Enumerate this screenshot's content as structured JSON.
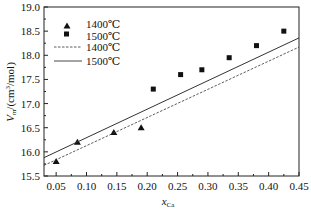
{
  "chart_data": {
    "type": "scatter",
    "title": "",
    "xlabel": "x_Ca",
    "xlabel_main": "x",
    "xlabel_sub": "Ca",
    "ylabel": "V_m/(cm³/mol)",
    "ylabel_main": "V",
    "ylabel_sub": "m",
    "ylabel_rest": "/(cm",
    "ylabel_sup": "3",
    "ylabel_end": "/mol)",
    "xlim": [
      0.03,
      0.45
    ],
    "ylim": [
      15.5,
      19.0
    ],
    "xticks": [
      "0.05",
      "0.10",
      "0.15",
      "0.20",
      "0.25",
      "0.30",
      "0.35",
      "0.40",
      "0.45"
    ],
    "yticks": [
      "15.5",
      "16.0",
      "16.5",
      "17.0",
      "17.5",
      "18.0",
      "18.5",
      "19.0"
    ],
    "grid": false,
    "legend_position": "upper left",
    "series": [
      {
        "name": "1400℃",
        "kind": "points",
        "marker": "triangle",
        "x": [
          0.05,
          0.085,
          0.145,
          0.19
        ],
        "y": [
          15.8,
          16.2,
          16.4,
          16.5
        ]
      },
      {
        "name": "1500℃",
        "kind": "points",
        "marker": "square",
        "x": [
          0.21,
          0.255,
          0.29,
          0.335,
          0.38,
          0.425
        ],
        "y": [
          17.3,
          17.6,
          17.7,
          17.95,
          18.2,
          18.5
        ]
      },
      {
        "name": "1400℃",
        "kind": "fit-line",
        "style": "dashed",
        "x": [
          0.03,
          0.45
        ],
        "y": [
          15.72,
          18.17
        ]
      },
      {
        "name": "1500℃",
        "kind": "fit-line",
        "style": "solid",
        "x": [
          0.03,
          0.45
        ],
        "y": [
          15.88,
          18.36
        ]
      }
    ]
  },
  "legend": {
    "items": [
      {
        "label": "1400℃",
        "symbol": "triangle"
      },
      {
        "label": "1500℃",
        "symbol": "square"
      },
      {
        "label": "1400℃",
        "symbol": "dashed-line"
      },
      {
        "label": "1500℃",
        "symbol": "solid-line"
      }
    ]
  }
}
